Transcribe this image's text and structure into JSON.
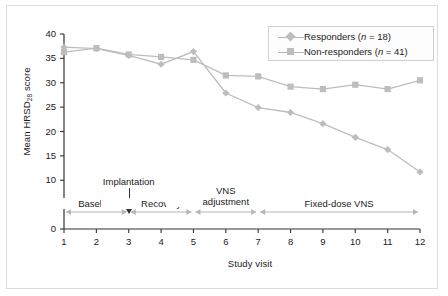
{
  "figure": {
    "background": "#ffffff",
    "border_color": "#dcdcdc"
  },
  "chart_data": {
    "type": "line",
    "title": "",
    "xlabel": "Study visit",
    "ylabel_text": "Mean HRSD",
    "ylabel_sub": "28",
    "ylabel_tail": " score",
    "xlim": [
      1,
      12
    ],
    "ylim": [
      0,
      40
    ],
    "yticks": [
      0,
      5,
      10,
      15,
      20,
      25,
      30,
      35,
      40
    ],
    "xticks": [
      1,
      2,
      3,
      4,
      5,
      6,
      7,
      8,
      9,
      10,
      11,
      12
    ],
    "grid": false,
    "legend_position": "top-right",
    "x": [
      1,
      2,
      3,
      4,
      5,
      6,
      7,
      8,
      9,
      10,
      11,
      12
    ],
    "series": [
      {
        "name": "Responders",
        "label": "Responders (n = 18)",
        "n": 18,
        "marker": "diamond",
        "color": "#bdbdbd",
        "values": [
          37.3,
          37.0,
          35.6,
          33.8,
          36.4,
          27.9,
          24.9,
          23.9,
          21.6,
          18.8,
          16.3,
          11.7
        ]
      },
      {
        "name": "Non-responders",
        "label": "Non-responders (n = 41)",
        "n": 41,
        "marker": "square",
        "color": "#bdbdbd",
        "values": [
          36.3,
          37.1,
          35.8,
          35.3,
          34.7,
          31.5,
          31.3,
          29.2,
          28.7,
          29.6,
          28.7,
          30.5
        ]
      }
    ],
    "annotations": [
      {
        "label": "Implantation",
        "at_visit": 3,
        "kind": "arrow-down"
      },
      {
        "label": "Baseline",
        "from_visit": 1,
        "to_visit": 3,
        "kind": "phase-bracket"
      },
      {
        "label": "Recovery",
        "from_visit": 3,
        "to_visit": 5,
        "kind": "phase-bracket"
      },
      {
        "label": "VNS adjustment",
        "line1": "VNS",
        "line2": "adjustment",
        "from_visit": 5,
        "to_visit": 7,
        "kind": "phase-bracket"
      },
      {
        "label": "Fixed-dose VNS",
        "from_visit": 7,
        "to_visit": 12,
        "kind": "phase-bracket"
      }
    ]
  }
}
